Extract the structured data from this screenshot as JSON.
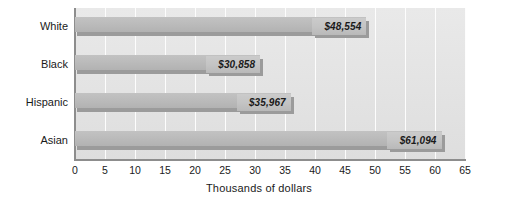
{
  "chart_data": {
    "type": "bar",
    "orientation": "horizontal",
    "title": "",
    "subtitle": "",
    "xlabel": "Thousands of dollars",
    "ylabel": "",
    "categories": [
      "White",
      "Black",
      "Hispanic",
      "Asian"
    ],
    "values": [
      48.554,
      30.858,
      35.967,
      61.094
    ],
    "data_labels": [
      "$48,554",
      "$30,858",
      "$35,967",
      "$61,094"
    ],
    "xlim": [
      0,
      65
    ],
    "xticks": [
      0,
      5,
      10,
      15,
      20,
      25,
      30,
      35,
      40,
      45,
      50,
      55,
      60,
      65
    ],
    "xtick_labels": [
      "0",
      "5",
      "10",
      "15",
      "20",
      "25",
      "30",
      "35",
      "40",
      "45",
      "50",
      "55",
      "60",
      "65"
    ],
    "grid": true,
    "grid_axis": "x",
    "legend": false,
    "legend_position": "none",
    "series": [
      {
        "name": "Median household income",
        "values": [
          48.554,
          30.858,
          35.967,
          61.094
        ]
      }
    ],
    "colors": {
      "bar_fill": "#bdbdbd",
      "bar_shadow": "#9b9b9b",
      "plot_background": "#e4e4e4",
      "gridline": "#fdfdfd",
      "axis_line": "#8d8d8d",
      "text": "#1a1a1a"
    }
  }
}
